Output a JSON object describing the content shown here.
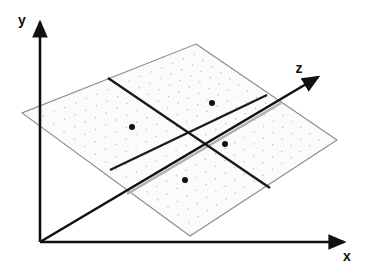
{
  "figure": {
    "background_color": "#ffffff",
    "width": 368,
    "height": 271
  },
  "axes": {
    "origin": {
      "x": 40,
      "y": 242
    },
    "stroke_color": "#111111",
    "items": [
      {
        "name": "y-axis",
        "label": "y",
        "label_x": 22,
        "label_y": 25,
        "from_x": 40,
        "from_y": 242,
        "to_x": 40,
        "to_y": 22,
        "arrow": true,
        "color": "#111111"
      },
      {
        "name": "x-axis",
        "label": "x",
        "label_x": 347,
        "label_y": 261,
        "from_x": 40,
        "from_y": 242,
        "to_x": 344,
        "to_y": 242,
        "arrow": true,
        "color": "#111111"
      },
      {
        "name": "z-axis",
        "label": "z",
        "label_x": 299,
        "label_y": 73,
        "from_x": 40,
        "from_y": 242,
        "to_x": 318,
        "to_y": 77,
        "arrow": true,
        "color": "#111111"
      }
    ]
  },
  "plane": {
    "name": "grid-plane",
    "fill_color": "#fbfbfb",
    "edge_color": "#8c8c8c",
    "dot_color": "#b9b9b9",
    "corners": {
      "top": {
        "x": 196,
        "y": 44
      },
      "right": {
        "x": 337,
        "y": 140
      },
      "bottom": {
        "x": 190,
        "y": 236
      },
      "left": {
        "x": 22,
        "y": 113
      }
    },
    "grid": {
      "divisions_u": 16,
      "divisions_v": 16,
      "style": "dotted"
    }
  },
  "quadrant_lines": {
    "name": "quadrant-divider-lines",
    "color": "#1a1a1a",
    "width": 2.4,
    "lines": [
      {
        "name": "divider-line-a",
        "x1": 108,
        "y1": 78,
        "x2": 270,
        "y2": 188
      },
      {
        "name": "divider-line-b",
        "x1": 110,
        "y1": 170,
        "x2": 267,
        "y2": 95
      }
    ]
  },
  "occluded_z_segment": {
    "name": "z-axis-under-plane",
    "color": "#b0b0b0",
    "width": 2.6,
    "x1": 127,
    "y1": 194,
    "x2": 281,
    "y2": 103
  },
  "points": {
    "name": "quadrant-center-points",
    "color": "#111111",
    "radius": 3,
    "items": [
      {
        "name": "point-left",
        "x": 132,
        "y": 127
      },
      {
        "name": "point-top",
        "x": 212,
        "y": 103
      },
      {
        "name": "point-right",
        "x": 225,
        "y": 144
      },
      {
        "name": "point-bottom",
        "x": 185,
        "y": 180
      }
    ]
  }
}
